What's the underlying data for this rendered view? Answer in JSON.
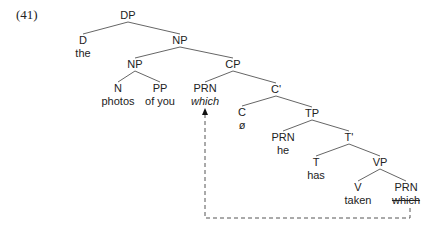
{
  "example_number": "(41)",
  "nodes": {
    "dp": {
      "label": "DP",
      "x": 128,
      "y": 9
    },
    "d": {
      "label": "D",
      "x": 83,
      "y": 34,
      "word": "the"
    },
    "np_top": {
      "label": "NP",
      "x": 180,
      "y": 34
    },
    "np_inner": {
      "label": "NP",
      "x": 135,
      "y": 58
    },
    "n": {
      "label": "N",
      "x": 118,
      "y": 82,
      "word": "photos"
    },
    "pp": {
      "label": "PP",
      "x": 160,
      "y": 82,
      "word": "of you"
    },
    "cp": {
      "label": "CP",
      "x": 233,
      "y": 58
    },
    "prn_which": {
      "label": "PRN",
      "x": 205,
      "y": 82,
      "word": "which"
    },
    "c_bar": {
      "label": "C'",
      "x": 276,
      "y": 83
    },
    "c": {
      "label": "C",
      "x": 242,
      "y": 106,
      "word": "ø"
    },
    "tp": {
      "label": "TP",
      "x": 312,
      "y": 107
    },
    "prn_he": {
      "label": "PRN",
      "x": 283,
      "y": 131,
      "word": "he"
    },
    "t_bar": {
      "label": "T'",
      "x": 349,
      "y": 131
    },
    "t": {
      "label": "T",
      "x": 316,
      "y": 156,
      "word": "has"
    },
    "vp": {
      "label": "VP",
      "x": 380,
      "y": 156
    },
    "v": {
      "label": "V",
      "x": 358,
      "y": 181,
      "word": "taken"
    },
    "prn_trace": {
      "label": "PRN",
      "x": 406,
      "y": 181,
      "word": "which"
    }
  },
  "edges": [
    [
      "dp",
      "d"
    ],
    [
      "dp",
      "np_top"
    ],
    [
      "np_top",
      "np_inner"
    ],
    [
      "np_top",
      "cp"
    ],
    [
      "np_inner",
      "n"
    ],
    [
      "np_inner",
      "pp"
    ],
    [
      "cp",
      "prn_which"
    ],
    [
      "cp",
      "c_bar"
    ],
    [
      "c_bar",
      "c"
    ],
    [
      "c_bar",
      "tp"
    ],
    [
      "tp",
      "prn_he"
    ],
    [
      "tp",
      "t_bar"
    ],
    [
      "t_bar",
      "t"
    ],
    [
      "t_bar",
      "vp"
    ],
    [
      "vp",
      "v"
    ],
    [
      "vp",
      "prn_trace"
    ]
  ],
  "movement_arrow": {
    "from": "prn_trace",
    "to": "prn_which",
    "style": "dashed",
    "bottom_y": 218,
    "color": "#555555"
  }
}
